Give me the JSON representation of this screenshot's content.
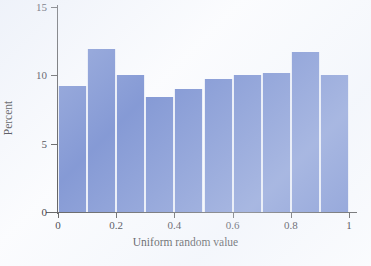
{
  "chart_data": {
    "type": "bar",
    "title": "",
    "subtitle": "",
    "xlabel": "Uniform random value",
    "ylabel": "Percent",
    "grid": false,
    "legend": null,
    "xlim": [
      0,
      1
    ],
    "ylim": [
      0,
      15
    ],
    "bin_edges": [
      0,
      0.1,
      0.2,
      0.3,
      0.4,
      0.5,
      0.6,
      0.7,
      0.8,
      0.9,
      1
    ],
    "categories": [
      "0-0.1",
      "0.1-0.2",
      "0.2-0.3",
      "0.3-0.4",
      "0.4-0.5",
      "0.5-0.6",
      "0.6-0.7",
      "0.7-0.8",
      "0.8-0.9",
      "0.9-1"
    ],
    "values": [
      9.2,
      11.9,
      10.0,
      8.4,
      9.0,
      9.7,
      10.0,
      10.2,
      11.7,
      10.0
    ],
    "xticks": [
      0,
      0.2,
      0.4,
      0.6,
      0.8,
      1
    ],
    "xtick_labels": [
      "0",
      "0.2",
      "0.4",
      "0.6",
      "0.8",
      "1"
    ],
    "yticks": [
      0,
      5,
      10,
      15
    ],
    "ytick_labels": [
      "0",
      "5",
      "10",
      "15"
    ],
    "bar_color": "#7189ce",
    "bar_edge_color": "#e9edf7",
    "axis_color": "#4a4a4a",
    "background_color": "#fbfcfe"
  }
}
